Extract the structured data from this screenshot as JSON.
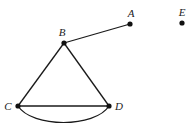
{
  "graph": {
    "colors": {
      "stroke": "#1a1a1a",
      "node": "#111111",
      "label": "#222222",
      "background": "#ffffff"
    },
    "nodes": [
      {
        "id": "A",
        "label": "A",
        "x": 130,
        "y": 24,
        "lx": 131,
        "ly": 15
      },
      {
        "id": "B",
        "label": "B",
        "x": 64,
        "y": 43,
        "lx": 62,
        "ly": 34
      },
      {
        "id": "C",
        "label": "C",
        "x": 18,
        "y": 106,
        "lx": 7,
        "ly": 110
      },
      {
        "id": "D",
        "label": "D",
        "x": 109,
        "y": 106,
        "lx": 119,
        "ly": 110
      },
      {
        "id": "E",
        "label": "E",
        "x": 182,
        "y": 23,
        "lx": 182,
        "ly": 14
      }
    ],
    "edges": [
      {
        "from": "B",
        "to": "A",
        "type": "straight"
      },
      {
        "from": "B",
        "to": "C",
        "type": "straight"
      },
      {
        "from": "B",
        "to": "D",
        "type": "straight"
      },
      {
        "from": "C",
        "to": "D",
        "type": "straight"
      },
      {
        "from": "C",
        "to": "D",
        "type": "curved"
      }
    ]
  }
}
